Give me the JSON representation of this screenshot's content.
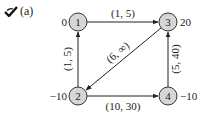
{
  "header": {
    "icon": "check-icon",
    "label": "(a)"
  },
  "graph": {
    "node_fill": "#d6d6d6",
    "edge_color": "#222222",
    "nodes": [
      {
        "id": "1",
        "label": "1",
        "supply": "0",
        "x": 78,
        "y": 22
      },
      {
        "id": "2",
        "label": "2",
        "supply": "−10",
        "x": 78,
        "y": 96
      },
      {
        "id": "3",
        "label": "3",
        "supply": "20",
        "x": 168,
        "y": 22
      },
      {
        "id": "4",
        "label": "4",
        "supply": "−10",
        "x": 168,
        "y": 96
      }
    ],
    "edges": [
      {
        "from": "1",
        "to": "3",
        "label": "(1, 5)"
      },
      {
        "from": "2",
        "to": "1",
        "label": "(1, 5)"
      },
      {
        "from": "3",
        "to": "2",
        "label": "(6, ∞)"
      },
      {
        "from": "2",
        "to": "4",
        "label": "(10, 30)"
      },
      {
        "from": "4",
        "to": "3",
        "label": "(5, 40)"
      }
    ]
  }
}
